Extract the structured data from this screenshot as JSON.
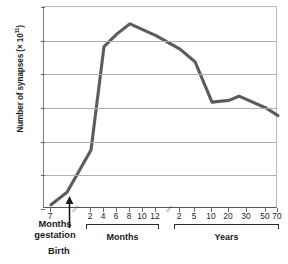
{
  "chart_data": {
    "type": "line",
    "title": "",
    "xlabel": "",
    "ylabel": "Number of synapses (× 10¹¹)",
    "ylabel_main": "Number of synapses (× 10",
    "ylabel_exp": "11",
    "ylabel_close": ")",
    "ylim": [
      0,
      24
    ],
    "yticks": [
      0,
      4,
      8,
      12,
      16,
      20,
      24
    ],
    "grid": true,
    "legend": "none",
    "line_color": "#5c5c5c",
    "axis_color": "#6a6a6a",
    "gridline_color": "#b0b0b0",
    "x_segments": [
      {
        "name": "gestation",
        "group_label": "Months gestation",
        "group_label_line1": "Months",
        "group_label_line2": "gestation",
        "ticks": [
          "7"
        ],
        "has_brace": false
      },
      {
        "name": "months",
        "group_label": "Months",
        "ticks": [
          "2",
          "4",
          "6",
          "8",
          "10",
          "12"
        ],
        "has_brace": true
      },
      {
        "name": "years",
        "group_label": "Years",
        "ticks": [
          "2",
          "5",
          "10",
          "20",
          "30",
          "50",
          "70"
        ],
        "has_brace": true
      }
    ],
    "axis_breaks": 2,
    "birth_marker_label": "Birth",
    "points": [
      {
        "x_label": "7 months gestation",
        "segment": "gestation",
        "value": 0.5
      },
      {
        "x_label": "Birth",
        "segment": "gestation",
        "value": 2.0
      },
      {
        "x_label": "2 months",
        "segment": "months",
        "value": 7.0
      },
      {
        "x_label": "4 months",
        "segment": "months",
        "value": 19.3
      },
      {
        "x_label": "6 months",
        "segment": "months",
        "value": 20.8
      },
      {
        "x_label": "8 months",
        "segment": "months",
        "value": 22.0
      },
      {
        "x_label": "12 months",
        "segment": "months",
        "value": 20.6
      },
      {
        "x_label": "2 years",
        "segment": "years",
        "value": 19.0
      },
      {
        "x_label": "5 years",
        "segment": "years",
        "value": 17.5
      },
      {
        "x_label": "10 years",
        "segment": "years",
        "value": 12.7
      },
      {
        "x_label": "20 years",
        "segment": "years",
        "value": 12.9
      },
      {
        "x_label": "25 years",
        "segment": "years",
        "value": 13.4
      },
      {
        "x_label": "50 years",
        "segment": "years",
        "value": 12.0
      },
      {
        "x_label": "70 years",
        "segment": "years",
        "value": 11.1
      }
    ]
  }
}
